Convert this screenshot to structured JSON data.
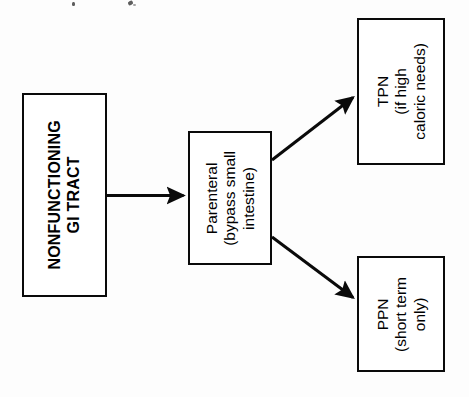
{
  "diagram": {
    "orientation": "rotated-90-ccw",
    "background_color": "#fdfdfd",
    "line_color": "#0a0a0a",
    "nodes": [
      {
        "id": "source",
        "label": "NONFUNCTIONING\nGI TRACT",
        "line1": "NONFUNCTIONING",
        "line2": "GI TRACT",
        "bold": true
      },
      {
        "id": "route",
        "label": "Parenteral\n(bypass small\nintestine)",
        "line1": "Parenteral",
        "line2": "(bypass small",
        "line3": "intestine)",
        "bold": false
      },
      {
        "id": "tpn",
        "label": "TPN\n(if high\ncaloric needs)",
        "line1": "TPN",
        "line2": "(if high",
        "line3": "caloric needs)",
        "bold": false
      },
      {
        "id": "ppn",
        "label": "PPN\n(short term\nonly)",
        "line1": "PPN",
        "line2": "(short term",
        "line3": "only)",
        "bold": false
      }
    ],
    "edges": [
      {
        "id": "source-to-route",
        "from": "source",
        "to": "route",
        "style": "straight-arrow"
      },
      {
        "id": "route-to-tpn",
        "from": "route",
        "to": "tpn",
        "style": "diagonal-arrow"
      },
      {
        "id": "route-to-ppn",
        "from": "route",
        "to": "ppn",
        "style": "diagonal-arrow"
      }
    ]
  }
}
